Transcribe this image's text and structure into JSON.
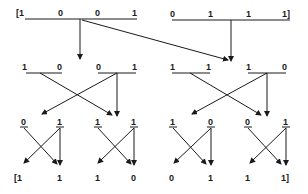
{
  "diagram": {
    "type": "butterfly-permutation",
    "levels": [
      {
        "name": "level-1",
        "groups": [
          {
            "labels": [
              "[1",
              "0",
              "0",
              "1"
            ]
          },
          {
            "labels": [
              "0",
              "1",
              "1",
              "1]"
            ]
          }
        ]
      },
      {
        "name": "level-2",
        "groups": [
          {
            "labels": [
              "1",
              "0"
            ]
          },
          {
            "labels": [
              "0",
              "1"
            ]
          },
          {
            "labels": [
              "1",
              "1"
            ]
          },
          {
            "labels": [
              "1",
              "0"
            ]
          }
        ]
      },
      {
        "name": "level-3",
        "groups": [
          {
            "labels": [
              "0"
            ]
          },
          {
            "labels": [
              "1"
            ]
          },
          {
            "labels": [
              "1"
            ]
          },
          {
            "labels": [
              "1"
            ]
          },
          {
            "labels": [
              "1"
            ]
          },
          {
            "labels": [
              "0"
            ]
          },
          {
            "labels": [
              "0"
            ]
          },
          {
            "labels": [
              "1"
            ]
          }
        ]
      },
      {
        "name": "output",
        "labels": [
          "[1",
          "1",
          "1",
          "0",
          "0",
          "1",
          "1",
          "1]"
        ]
      }
    ],
    "colors": {
      "ink": "#1a1a1a",
      "background": "#ffffff"
    }
  }
}
